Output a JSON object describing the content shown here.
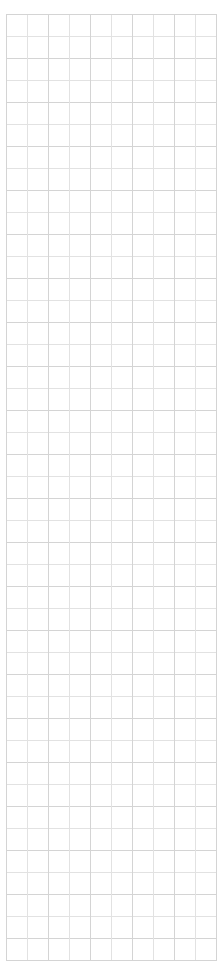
{
  "page": {
    "width": 223,
    "height": 937,
    "background_color": "#ffffff"
  },
  "grid": {
    "name": "empty-grid",
    "columns": 10,
    "rows": 43,
    "cell_width": 21,
    "cell_height": 21,
    "origin_x": 6,
    "origin_y": 14,
    "total_width": 210,
    "total_height": 907,
    "line_color": "#d4d4d4",
    "line_color_soft": "#e2e2e2",
    "cell_background": "#ffffff",
    "is_empty": true,
    "cells": [
      [
        "",
        "",
        "",
        "",
        "",
        "",
        "",
        "",
        "",
        ""
      ],
      [
        "",
        "",
        "",
        "",
        "",
        "",
        "",
        "",
        "",
        ""
      ],
      [
        "",
        "",
        "",
        "",
        "",
        "",
        "",
        "",
        "",
        ""
      ],
      [
        "",
        "",
        "",
        "",
        "",
        "",
        "",
        "",
        "",
        ""
      ],
      [
        "",
        "",
        "",
        "",
        "",
        "",
        "",
        "",
        "",
        ""
      ],
      [
        "",
        "",
        "",
        "",
        "",
        "",
        "",
        "",
        "",
        ""
      ],
      [
        "",
        "",
        "",
        "",
        "",
        "",
        "",
        "",
        "",
        ""
      ],
      [
        "",
        "",
        "",
        "",
        "",
        "",
        "",
        "",
        "",
        ""
      ],
      [
        "",
        "",
        "",
        "",
        "",
        "",
        "",
        "",
        "",
        ""
      ],
      [
        "",
        "",
        "",
        "",
        "",
        "",
        "",
        "",
        "",
        ""
      ],
      [
        "",
        "",
        "",
        "",
        "",
        "",
        "",
        "",
        "",
        ""
      ],
      [
        "",
        "",
        "",
        "",
        "",
        "",
        "",
        "",
        "",
        ""
      ],
      [
        "",
        "",
        "",
        "",
        "",
        "",
        "",
        "",
        "",
        ""
      ],
      [
        "",
        "",
        "",
        "",
        "",
        "",
        "",
        "",
        "",
        ""
      ],
      [
        "",
        "",
        "",
        "",
        "",
        "",
        "",
        "",
        "",
        ""
      ],
      [
        "",
        "",
        "",
        "",
        "",
        "",
        "",
        "",
        "",
        ""
      ],
      [
        "",
        "",
        "",
        "",
        "",
        "",
        "",
        "",
        "",
        ""
      ],
      [
        "",
        "",
        "",
        "",
        "",
        "",
        "",
        "",
        "",
        ""
      ],
      [
        "",
        "",
        "",
        "",
        "",
        "",
        "",
        "",
        "",
        ""
      ],
      [
        "",
        "",
        "",
        "",
        "",
        "",
        "",
        "",
        "",
        ""
      ],
      [
        "",
        "",
        "",
        "",
        "",
        "",
        "",
        "",
        "",
        ""
      ],
      [
        "",
        "",
        "",
        "",
        "",
        "",
        "",
        "",
        "",
        ""
      ],
      [
        "",
        "",
        "",
        "",
        "",
        "",
        "",
        "",
        "",
        ""
      ],
      [
        "",
        "",
        "",
        "",
        "",
        "",
        "",
        "",
        "",
        ""
      ],
      [
        "",
        "",
        "",
        "",
        "",
        "",
        "",
        "",
        "",
        ""
      ],
      [
        "",
        "",
        "",
        "",
        "",
        "",
        "",
        "",
        "",
        ""
      ],
      [
        "",
        "",
        "",
        "",
        "",
        "",
        "",
        "",
        "",
        ""
      ],
      [
        "",
        "",
        "",
        "",
        "",
        "",
        "",
        "",
        "",
        ""
      ],
      [
        "",
        "",
        "",
        "",
        "",
        "",
        "",
        "",
        "",
        ""
      ],
      [
        "",
        "",
        "",
        "",
        "",
        "",
        "",
        "",
        "",
        ""
      ],
      [
        "",
        "",
        "",
        "",
        "",
        "",
        "",
        "",
        "",
        ""
      ],
      [
        "",
        "",
        "",
        "",
        "",
        "",
        "",
        "",
        "",
        ""
      ],
      [
        "",
        "",
        "",
        "",
        "",
        "",
        "",
        "",
        "",
        ""
      ],
      [
        "",
        "",
        "",
        "",
        "",
        "",
        "",
        "",
        "",
        ""
      ],
      [
        "",
        "",
        "",
        "",
        "",
        "",
        "",
        "",
        "",
        ""
      ],
      [
        "",
        "",
        "",
        "",
        "",
        "",
        "",
        "",
        "",
        ""
      ],
      [
        "",
        "",
        "",
        "",
        "",
        "",
        "",
        "",
        "",
        ""
      ],
      [
        "",
        "",
        "",
        "",
        "",
        "",
        "",
        "",
        "",
        ""
      ],
      [
        "",
        "",
        "",
        "",
        "",
        "",
        "",
        "",
        "",
        ""
      ],
      [
        "",
        "",
        "",
        "",
        "",
        "",
        "",
        "",
        "",
        ""
      ],
      [
        "",
        "",
        "",
        "",
        "",
        "",
        "",
        "",
        "",
        ""
      ],
      [
        "",
        "",
        "",
        "",
        "",
        "",
        "",
        "",
        "",
        ""
      ],
      [
        "",
        "",
        "",
        "",
        "",
        "",
        "",
        "",
        "",
        ""
      ]
    ]
  }
}
